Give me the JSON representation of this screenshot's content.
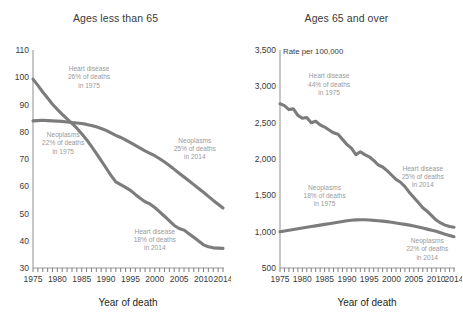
{
  "chart_data": [
    {
      "type": "line",
      "panel_id": "ages-less-than-65",
      "title": "Ages less than 65",
      "xlabel": "Year of death",
      "ylabel": "",
      "unit_label": "",
      "xlim": [
        1975,
        2014
      ],
      "ylim": [
        30,
        110
      ],
      "yticks": [
        30,
        40,
        50,
        60,
        70,
        80,
        90,
        100,
        110
      ],
      "ytick_labels": [
        "30",
        "40",
        "50",
        "60",
        "70",
        "80",
        "90",
        "100",
        "110"
      ],
      "xticks_labeled": [
        1975,
        1980,
        1985,
        1990,
        1995,
        2000,
        2005,
        2010,
        2014
      ],
      "xtick_labels": [
        "1975",
        "1980",
        "1985",
        "1990",
        "1995",
        "2000",
        "2005",
        "2010",
        "2014"
      ],
      "xtick_step_minor": 1,
      "grid": false,
      "legend": "none",
      "x": [
        1975,
        1976,
        1977,
        1978,
        1979,
        1980,
        1981,
        1982,
        1983,
        1984,
        1985,
        1986,
        1987,
        1988,
        1989,
        1990,
        1991,
        1992,
        1993,
        1994,
        1995,
        1996,
        1997,
        1998,
        1999,
        2000,
        2001,
        2002,
        2003,
        2004,
        2005,
        2006,
        2007,
        2008,
        2009,
        2010,
        2011,
        2012,
        2013,
        2014
      ],
      "series": [
        {
          "name": "Heart disease",
          "color": "#7c7c7c",
          "values": [
            99.3,
            97.0,
            94.6,
            92.4,
            90.1,
            88.2,
            86.4,
            84.7,
            83.1,
            81.3,
            79.3,
            77.1,
            74.6,
            72.1,
            69.4,
            66.7,
            64.0,
            61.6,
            60.6,
            59.6,
            58.5,
            57.0,
            55.6,
            54.3,
            53.5,
            52.2,
            50.6,
            49.0,
            47.3,
            45.6,
            44.5,
            43.9,
            42.6,
            41.3,
            39.9,
            38.5,
            37.8,
            37.4,
            37.3,
            37.2
          ]
        },
        {
          "name": "Neoplasms",
          "color": "#7c7c7c",
          "values": [
            84.0,
            84.1,
            84.2,
            84.1,
            84.0,
            83.9,
            83.8,
            83.6,
            83.4,
            83.2,
            83.0,
            82.7,
            82.3,
            81.8,
            81.2,
            80.5,
            79.6,
            78.7,
            77.9,
            77.0,
            76.0,
            75.0,
            74.0,
            73.0,
            72.1,
            71.2,
            70.1,
            68.9,
            67.6,
            66.2,
            64.8,
            63.4,
            62.0,
            60.6,
            59.2,
            57.8,
            56.3,
            54.8,
            53.4,
            52.0
          ]
        }
      ],
      "annotations": [
        {
          "id": "heart-1975",
          "lines": [
            "Heart disease",
            "26% of deaths",
            "in 1975"
          ],
          "x": 1986.5,
          "y": 102.2
        },
        {
          "id": "neoplasms-1975",
          "lines": [
            "Neoplasms",
            "22% of deaths",
            "in 1975"
          ],
          "x": 1981.2,
          "y": 78.0
        },
        {
          "id": "neoplasms-2014",
          "lines": [
            "Neoplasms",
            "25% of deaths",
            "in 2014"
          ],
          "x": 2008.2,
          "y": 76.0
        },
        {
          "id": "heart-2014",
          "lines": [
            "Heart disease",
            "18% of deaths",
            "in 2014"
          ],
          "x": 2000.0,
          "y": 42.5
        }
      ]
    },
    {
      "type": "line",
      "panel_id": "ages-65-and-over",
      "title": "Ages 65 and over",
      "xlabel": "Year of death",
      "ylabel": "",
      "unit_label": "Rate per 100,000",
      "xlim": [
        1975,
        2014
      ],
      "ylim": [
        500,
        3500
      ],
      "yticks": [
        500,
        1000,
        1500,
        2000,
        2500,
        3000,
        3500
      ],
      "ytick_labels": [
        "500",
        "1,000",
        "1,500",
        "2,000",
        "2,500",
        "3,000",
        "3,500"
      ],
      "xticks_labeled": [
        1975,
        1980,
        1985,
        1990,
        1995,
        2000,
        2005,
        2010,
        2014
      ],
      "xtick_labels": [
        "1975",
        "1980",
        "1985",
        "1990",
        "1995",
        "2000",
        "2005",
        "2010",
        "2014"
      ],
      "xtick_step_minor": 1,
      "grid": false,
      "legend": "none",
      "x": [
        1975,
        1976,
        1977,
        1978,
        1979,
        1980,
        1981,
        1982,
        1983,
        1984,
        1985,
        1986,
        1987,
        1988,
        1989,
        1990,
        1991,
        1992,
        1993,
        1994,
        1995,
        1996,
        1997,
        1998,
        1999,
        2000,
        2001,
        2002,
        2003,
        2004,
        2005,
        2006,
        2007,
        2008,
        2009,
        2010,
        2011,
        2012,
        2013,
        2014
      ],
      "series": [
        {
          "name": "Heart disease",
          "color": "#7c7c7c",
          "values": [
            2760,
            2735,
            2680,
            2690,
            2600,
            2560,
            2570,
            2500,
            2520,
            2470,
            2440,
            2400,
            2360,
            2340,
            2270,
            2200,
            2150,
            2060,
            2100,
            2060,
            2030,
            1980,
            1920,
            1890,
            1840,
            1780,
            1720,
            1680,
            1620,
            1540,
            1470,
            1400,
            1330,
            1280,
            1220,
            1160,
            1120,
            1090,
            1070,
            1060
          ]
        },
        {
          "name": "Neoplasms",
          "color": "#7c7c7c",
          "values": [
            1000,
            1010,
            1020,
            1030,
            1040,
            1050,
            1060,
            1070,
            1080,
            1090,
            1100,
            1110,
            1120,
            1130,
            1140,
            1150,
            1158,
            1162,
            1165,
            1163,
            1160,
            1155,
            1150,
            1145,
            1138,
            1130,
            1120,
            1110,
            1100,
            1090,
            1078,
            1065,
            1050,
            1035,
            1020,
            1005,
            985,
            965,
            948,
            930
          ]
        }
      ],
      "annotations": [
        {
          "id": "heart-1975",
          "lines": [
            "Heart disease",
            "44% of deaths",
            "in 1975"
          ],
          "x": 1986.0,
          "y": 3110
        },
        {
          "id": "neoplasms-1975",
          "lines": [
            "Neoplasms",
            "18% of deaths",
            "in 1975"
          ],
          "x": 1985.0,
          "y": 1580
        },
        {
          "id": "heart-2014",
          "lines": [
            "Heart disease",
            "25% of deaths",
            "in 2014"
          ],
          "x": 2007.0,
          "y": 1840
        },
        {
          "id": "neoplasms-2014",
          "lines": [
            "Neoplasms",
            "22% of deaths",
            "in 2014"
          ],
          "x": 2008.0,
          "y": 840
        }
      ]
    }
  ],
  "colors": {
    "line": "#7c7c7c",
    "annotation_text": "#9a9a9a",
    "axis": "#9a9a9a",
    "text": "#231f20",
    "background": "#ffffff"
  }
}
